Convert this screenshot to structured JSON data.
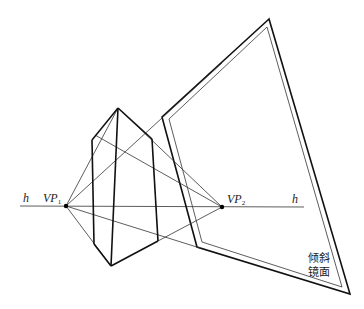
{
  "diagram": {
    "type": "two-point perspective with tilted mirror",
    "labels": {
      "horizon_left": "h",
      "horizon_right": "h",
      "vp1": "VP",
      "vp1_sub": "1",
      "vp2": "VP",
      "vp2_sub": "2",
      "mirror_line1": "倾斜",
      "mirror_line2": "镜面"
    },
    "colors": {
      "stroke": "#111111",
      "thin_stroke": "#333333",
      "background": "#ffffff"
    },
    "points": {
      "vp1": [
        66,
        206
      ],
      "vp2": [
        222,
        207
      ],
      "pyramid_apex": [
        118,
        108
      ],
      "pyramid_bottom": [
        111,
        266
      ],
      "mirror_top": [
        269,
        19
      ],
      "mirror_left": [
        162,
        117
      ],
      "mirror_bottom_left": [
        197,
        247
      ],
      "mirror_bottom_right": [
        350,
        294
      ]
    }
  }
}
